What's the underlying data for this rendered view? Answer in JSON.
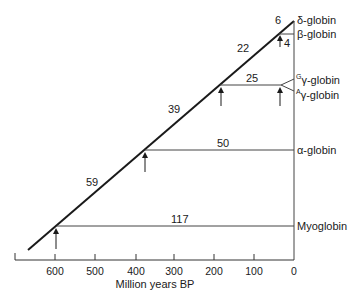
{
  "diagram": {
    "axis": {
      "label": "Million years BP",
      "ticks": [
        "600",
        "500",
        "400",
        "300",
        "200",
        "100",
        "0"
      ]
    },
    "branches": [
      {
        "name": "delta",
        "label": "δ-globin",
        "divergence": "6"
      },
      {
        "name": "beta",
        "label": "β-globin",
        "divergence": "4"
      },
      {
        "name": "g-gamma",
        "sup": "G",
        "label": "γ-globin"
      },
      {
        "name": "a-gamma",
        "sup": "A",
        "label": "γ-globin"
      },
      {
        "name": "alpha",
        "label": "α-globin"
      },
      {
        "name": "myoglobin",
        "label": "Myoglobin"
      }
    ],
    "edge_values": {
      "trunk_top": "22",
      "gamma_branch": "25",
      "trunk_mid": "39",
      "alpha_branch": "50",
      "trunk_low": "59",
      "myoglobin_branch": "117"
    }
  }
}
